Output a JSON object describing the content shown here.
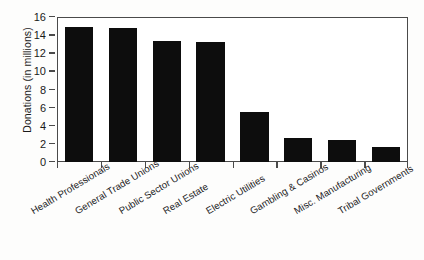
{
  "chart_data": {
    "type": "bar",
    "title": "",
    "xlabel": "",
    "ylabel": "Donations (in millions)",
    "ylim": [
      0,
      16
    ],
    "ytick_step": 2,
    "grid": false,
    "legend": "none",
    "orientation": "vertical",
    "bar_color": "#0d0d0d",
    "axis_color": "#4a4a4a",
    "background": "#ffffff",
    "xtick_label_rotation": -31,
    "categories": [
      "Health Professionals",
      "General Trade Unions",
      "Public Sector Unions",
      "Real Estate",
      "Electric Utilities",
      "Gambling & Casinos",
      "Misc. Manufacturing",
      "Tribal Governments"
    ],
    "values": [
      14.9,
      14.8,
      13.4,
      13.2,
      5.5,
      2.7,
      2.4,
      1.7
    ],
    "ytick_labels": [
      "0",
      "2",
      "4",
      "6",
      "8",
      "10",
      "12",
      "14",
      "16"
    ],
    "ytick_values": [
      0,
      2,
      4,
      6,
      8,
      10,
      12,
      14,
      16
    ]
  }
}
